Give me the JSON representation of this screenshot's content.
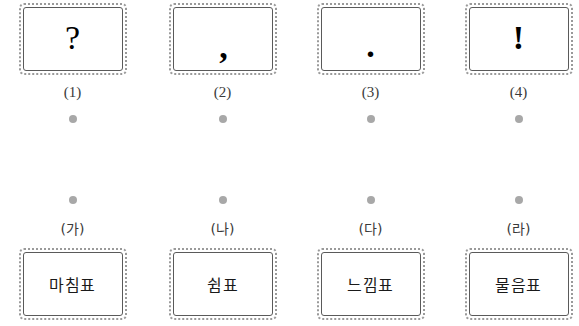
{
  "page": {
    "background_color": "#ffffff",
    "card_border_color": "#5a5a5a",
    "card_dash_color": "#9a9a9a",
    "dot_color": "#a8a8a8",
    "text_color": "#111111"
  },
  "columns": [
    {
      "top_card": {
        "symbol": "?",
        "symbol_name": "question-mark"
      },
      "top_label": "(1)",
      "bottom_label": "(가)",
      "bottom_card": {
        "term": "마침표"
      }
    },
    {
      "top_card": {
        "symbol": ",",
        "symbol_name": "comma"
      },
      "top_label": "(2)",
      "bottom_label": "(나)",
      "bottom_card": {
        "term": "쉼표"
      }
    },
    {
      "top_card": {
        "symbol": ".",
        "symbol_name": "period"
      },
      "top_label": "(3)",
      "bottom_label": "(다)",
      "bottom_card": {
        "term": "느낌표"
      }
    },
    {
      "top_card": {
        "symbol": "!",
        "symbol_name": "exclamation-mark"
      },
      "top_label": "(4)",
      "bottom_label": "(라)",
      "bottom_card": {
        "term": "물음표"
      }
    }
  ]
}
